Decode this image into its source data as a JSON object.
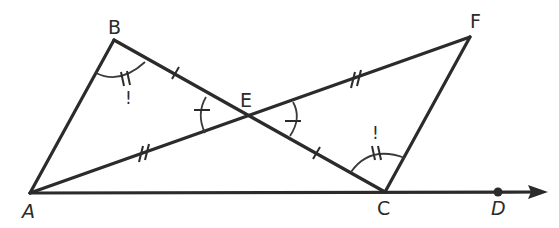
{
  "figure": {
    "points": {
      "A": {
        "label": "A"
      },
      "B": {
        "label": "B"
      },
      "C": {
        "label": "C"
      },
      "D": {
        "label": "D"
      },
      "E": {
        "label": "E"
      },
      "F": {
        "label": "F"
      }
    },
    "segments": [
      "AB",
      "BC",
      "AF",
      "FC",
      "AD-ray"
    ],
    "congruence_marks": {
      "single_tick_segments": [
        "BE",
        "EC"
      ],
      "double_tick_segments": [
        "AE",
        "EF"
      ],
      "single_tick_angles": [
        "AEB",
        "FEC"
      ],
      "double_tick_angles": [
        "ABE",
        "ECF"
      ]
    },
    "angle_annotations": {
      "B": "!",
      "C": "!"
    },
    "ink_color": "#2b2b2b",
    "background": "#ffffff"
  }
}
